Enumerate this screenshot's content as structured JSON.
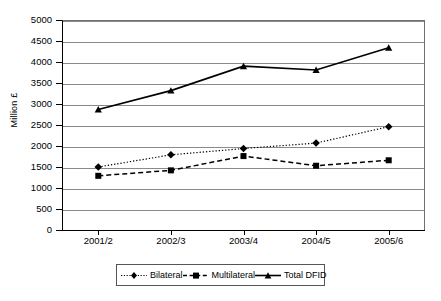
{
  "chart_data": {
    "type": "line",
    "title": "",
    "xlabel": "",
    "ylabel": "Million £",
    "ylim": [
      0,
      5000
    ],
    "ytick_step": 500,
    "yticks": [
      "0",
      "500",
      "1000",
      "1500",
      "2000",
      "2500",
      "3000",
      "3500",
      "4000",
      "4500",
      "5000"
    ],
    "grid": true,
    "legend_position": "bottom",
    "categories": [
      "2001/2",
      "2002/3",
      "2003/4",
      "2004/5",
      "2005/6"
    ],
    "series": [
      {
        "name": "Bilateral",
        "marker": "diamond",
        "linestyle": "dotted",
        "color": "#000000",
        "values": [
          1500,
          1790,
          1940,
          2070,
          2460
        ]
      },
      {
        "name": "Multilateral",
        "marker": "square",
        "linestyle": "dashed",
        "color": "#000000",
        "values": [
          1290,
          1420,
          1760,
          1530,
          1660
        ]
      },
      {
        "name": "Total DFID",
        "marker": "triangle",
        "linestyle": "solid",
        "color": "#000000",
        "values": [
          2870,
          3320,
          3900,
          3810,
          4340
        ]
      }
    ]
  }
}
